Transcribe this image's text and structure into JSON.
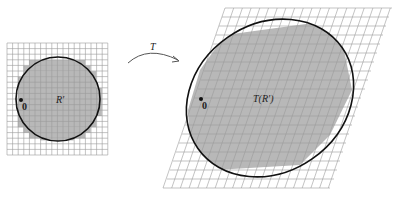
{
  "left_panel": {
    "region_label": "R′",
    "origin_label": "0",
    "grid": {
      "x0": 7,
      "y0": 43,
      "cols": 18,
      "rows": 20,
      "cell": 5.6
    },
    "colors": {
      "fill": "#b8b8b8",
      "grid": "#9a9a9a",
      "curve": "#111111"
    }
  },
  "arrow": {
    "label": "T"
  },
  "right_panel": {
    "region_label": "T(R′)",
    "origin_label": "0",
    "colors": {
      "fill": "#b8b8b8",
      "grid": "#9a9a9a",
      "curve": "#111111"
    }
  }
}
